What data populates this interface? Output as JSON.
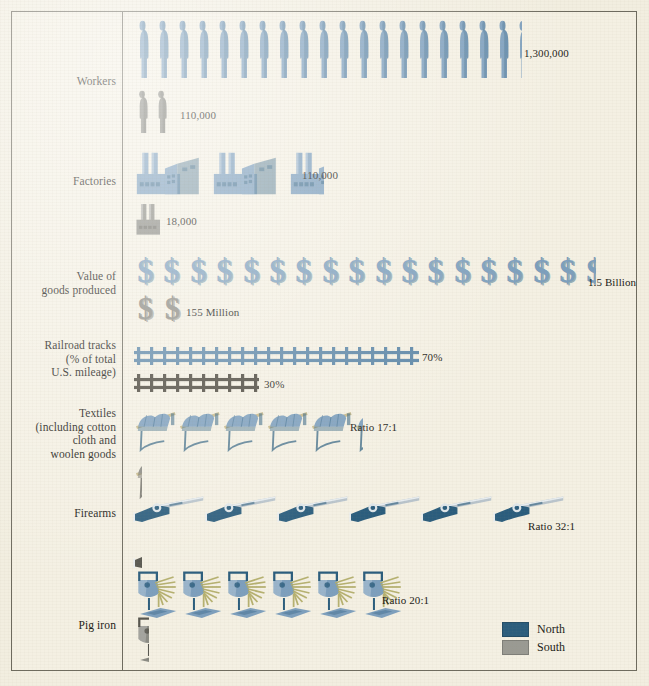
{
  "figure": {
    "background_color": "#f2eee0",
    "frame_color": "#6d6a5e"
  },
  "legend": {
    "items": [
      {
        "label": "North",
        "color": "#2b5d7d"
      },
      {
        "label": "South",
        "color": "#9a9a93"
      }
    ]
  },
  "colors": {
    "north": "#7d9fbd",
    "north_dark": "#2b5d7d",
    "south": "#8b8b84",
    "south_dark": "#57564f",
    "rail_north": "#5d87a8",
    "rail_south": "#4b473d",
    "text": "#1b1a16"
  },
  "chart_data": {
    "type": "pictogram",
    "title": "",
    "legend_position": "bottom-right",
    "categories": [
      "Workers",
      "Factories",
      "Value of goods produced",
      "Railroad tracks (% of total U.S. mileage)",
      "Textiles (including cotton cloth and woolen goods",
      "Firearms",
      "Pig iron"
    ],
    "series": [
      {
        "name": "North",
        "values": [
          "1,300,000",
          "110,000",
          "1.5 Billion",
          "70%",
          "Ratio 17:1",
          "Ratio 32:1",
          "Ratio 20:1"
        ]
      },
      {
        "name": "South",
        "values": [
          "110,000",
          "18,000",
          "155 Million",
          "30%",
          "",
          "",
          ""
        ]
      }
    ],
    "rows": [
      {
        "label": "Workers",
        "label_lines": [
          "Workers"
        ],
        "icon": "worker-icon",
        "north": {
          "count": 19,
          "partial": 0.45,
          "value": "1,300,000"
        },
        "south": {
          "count": 2,
          "partial": 0,
          "value": "110,000"
        }
      },
      {
        "label": "Factories",
        "label_lines": [
          "Factories"
        ],
        "icon": "factory-icon",
        "north": {
          "count": 2,
          "partial": 0.5,
          "value": "110,000"
        },
        "south": {
          "count": 0,
          "partial": 0.42,
          "value": "18,000"
        }
      },
      {
        "label": "Value of goods produced",
        "label_lines": [
          "Value of",
          "goods produced"
        ],
        "icon": "dollar-sign-icon",
        "north": {
          "count": 17,
          "partial": 0.5,
          "value": "1.5 Billion"
        },
        "south": {
          "count": 2,
          "partial": 0,
          "value": "155 Million"
        }
      },
      {
        "label": "Railroad tracks (% of total U.S. mileage)",
        "label_lines": [
          "Railroad tracks",
          "(% of total",
          "U.S. mileage)"
        ],
        "icon": "railroad-track-icon",
        "north": {
          "length_pct": 70,
          "value": "70%"
        },
        "south": {
          "length_pct": 30,
          "value": "30%"
        }
      },
      {
        "label": "Textiles (including cotton cloth and woolen goods",
        "label_lines": [
          "Textiles",
          "(including cotton",
          "cloth and",
          "woolen goods"
        ],
        "icon": "textile-loom-icon",
        "north": {
          "count": 5,
          "partial": 0.22,
          "value": "Ratio 17:1"
        },
        "south": {
          "count": 0,
          "partial": 0.18,
          "value": ""
        }
      },
      {
        "label": "Firearms",
        "label_lines": [
          "Firearms"
        ],
        "icon": "rifle-icon",
        "north": {
          "count": 6,
          "partial": 0,
          "value": "Ratio 32:1"
        },
        "south": {
          "count": 0,
          "partial": 0.14,
          "value": ""
        }
      },
      {
        "label": "Pig iron",
        "label_lines": [
          "Pig iron"
        ],
        "icon": "molten-iron-ladle-icon",
        "north": {
          "count": 6,
          "partial": 0,
          "value": "Ratio 20:1"
        },
        "south": {
          "count": 0,
          "partial": 0.35,
          "value": ""
        }
      }
    ]
  }
}
